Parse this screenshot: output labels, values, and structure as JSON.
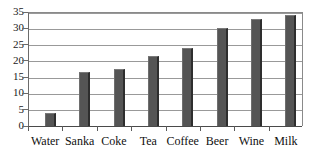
{
  "chart_data": {
    "type": "bar",
    "title": "",
    "subtitle": "",
    "xlabel": "",
    "ylabel": "",
    "categories": [
      "Water",
      "Sanka",
      "Coke",
      "Tea",
      "Coffee",
      "Beer",
      "Wine",
      "Milk"
    ],
    "values": [
      4,
      16.5,
      17.5,
      21.5,
      23.8,
      30,
      32.8,
      34
    ],
    "series": [
      {
        "name": "",
        "values": [
          4,
          16.5,
          17.5,
          21.5,
          23.8,
          30,
          32.8,
          34
        ]
      }
    ],
    "ylim": [
      0,
      35
    ],
    "xlim": null,
    "ytick_labels": [
      "0",
      "5",
      "10",
      "15",
      "20",
      "25",
      "30",
      "35"
    ],
    "ytick_values": [
      0,
      5,
      10,
      15,
      20,
      25,
      30,
      35
    ],
    "ytick_step": 5,
    "grid": "horizontal",
    "legend": "none",
    "legend_position": "none",
    "annotations": [],
    "bar_color": "#555555",
    "bar_edge_color": "#2e2e2e",
    "gridline_color": "#999999",
    "axis_color": "#4a4a4a",
    "background_color": "#ffffff",
    "text_color": "#101010"
  }
}
